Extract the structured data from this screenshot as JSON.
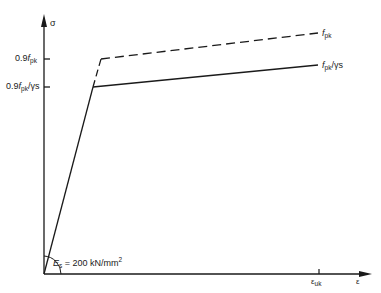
{
  "diagram": {
    "type": "stress-strain",
    "axes": {
      "y_label": "σ",
      "x_label": "ε"
    },
    "y_ticks": [
      {
        "label_prefix": "0.9",
        "label_var": "f",
        "label_sub": "pk",
        "label_suffix": ""
      },
      {
        "label_prefix": "0.9",
        "label_var": "f",
        "label_sub": "pk",
        "label_suffix": "/γs"
      }
    ],
    "x_ticks": [
      {
        "label_var": "ε",
        "label_sub": "uk"
      }
    ],
    "curves": [
      {
        "name": "characteristic",
        "style": "dashed",
        "end_label_var": "f",
        "end_label_sub": "pk",
        "end_label_suffix": ""
      },
      {
        "name": "design",
        "style": "solid",
        "end_label_var": "f",
        "end_label_sub": "pk",
        "end_label_suffix": "/γs"
      }
    ],
    "modulus": {
      "label_var": "E",
      "label_sub": "s",
      "label_value": " = 200 kN/mm",
      "label_sup": "2"
    },
    "colors": {
      "line": "#1a1a1a",
      "background": "#ffffff"
    }
  }
}
